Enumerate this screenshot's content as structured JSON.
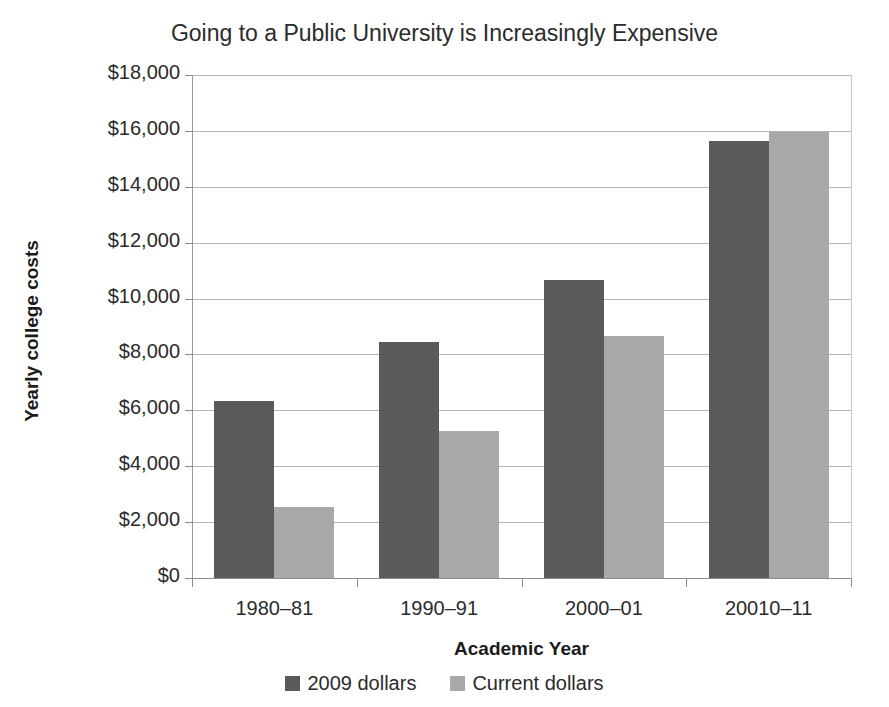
{
  "chart_data": {
    "type": "bar",
    "title": "Going to a Public University is Increasingly Expensive",
    "xlabel": "Academic Year",
    "ylabel": "Yearly college costs",
    "categories": [
      "1980–81",
      "1990–91",
      "2000–01",
      "20010–11"
    ],
    "series": [
      {
        "name": "2009 dollars",
        "color": "#5a5a5a",
        "values": [
          6330,
          8450,
          10650,
          15650
        ]
      },
      {
        "name": "Current dollars",
        "color": "#a8a8a8",
        "values": [
          2550,
          5250,
          8650,
          15950
        ]
      }
    ],
    "ylim": [
      0,
      18000
    ],
    "ytick_values": [
      0,
      2000,
      4000,
      6000,
      8000,
      10000,
      12000,
      14000,
      16000,
      18000
    ],
    "ytick_labels": [
      "$0",
      "$2,000",
      "$4,000",
      "$6,000",
      "$8,000",
      "$10,000",
      "$12,000",
      "$14,000",
      "$16,000",
      "$18,000"
    ],
    "grid": true,
    "legend_position": "bottom"
  },
  "colors": {
    "series_2009_dollars": "#5a5a5a",
    "series_current_dollars": "#a8a8a8",
    "gridline": "#b4b4b4",
    "axis": "#8c8c8c",
    "text": "#2b2b2b",
    "background": "#ffffff"
  }
}
